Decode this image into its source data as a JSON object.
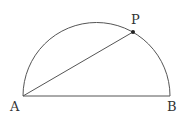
{
  "diagram": {
    "type": "semicircle-geometry",
    "points": {
      "A": {
        "label": "A",
        "x": 23,
        "y": 96
      },
      "B": {
        "label": "B",
        "x": 170,
        "y": 96
      },
      "P": {
        "label": "P",
        "x": 133,
        "y": 32
      }
    },
    "segments": [
      [
        "A",
        "B"
      ],
      [
        "A",
        "P"
      ]
    ],
    "arc": {
      "from": "B",
      "to": "A",
      "type": "semicircle"
    },
    "colors": {
      "stroke": "#555555",
      "point": "#222222",
      "label": "#333333"
    }
  }
}
